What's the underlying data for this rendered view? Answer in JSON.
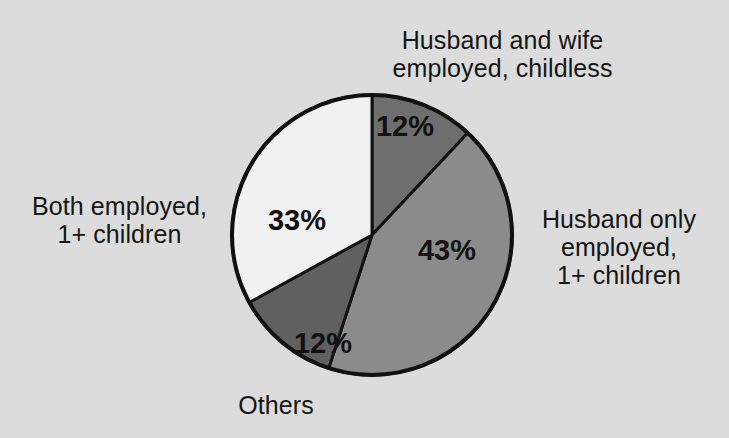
{
  "figure": {
    "background_color": "#dcdcdc",
    "title": ""
  },
  "chart_data": {
    "type": "pie",
    "title": "",
    "xlabel": "",
    "ylabel": "",
    "legend_position": "callouts-around-pie",
    "grid": false,
    "start_angle_deg": 0,
    "direction": "clockwise",
    "center": {
      "x": 372,
      "y": 235
    },
    "radius": 140,
    "categories": [
      "Husband and wife employed, childless",
      "Husband only employed, 1+ children",
      "Others",
      "Both employed, 1+ children"
    ],
    "values": [
      12,
      43,
      12,
      33
    ],
    "value_labels": [
      "12%",
      "43%",
      "12%",
      "33%"
    ],
    "colors": [
      "#6e6e6e",
      "#8b8b8b",
      "#606060",
      "#f1f1f1"
    ],
    "slices": [
      {
        "label": "Husband and wife employed, childless",
        "label_lines": [
          "Husband and wife",
          "employed, childless"
        ],
        "value": 12,
        "value_label": "12%",
        "color": "#6e6e6e",
        "start_deg": 0,
        "end_deg": 43.2,
        "value_x": 405,
        "value_y": 128
      },
      {
        "label": "Husband only employed, 1+ children",
        "label_lines": [
          "Husband only",
          "employed,",
          "1+ children"
        ],
        "value": 43,
        "value_label": "43%",
        "color": "#8b8b8b",
        "start_deg": 43.2,
        "end_deg": 198.0,
        "value_x": 447,
        "value_y": 252
      },
      {
        "label": "Others",
        "label_lines": [
          "Others"
        ],
        "value": 12,
        "value_label": "12%",
        "color": "#606060",
        "start_deg": 198.0,
        "end_deg": 241.2,
        "value_x": 323,
        "value_y": 345
      },
      {
        "label": "Both employed, 1+ children",
        "label_lines": [
          "Both employed,",
          "1+ children"
        ],
        "value": 33,
        "value_label": "33%",
        "color": "#f1f1f1",
        "start_deg": 241.2,
        "end_deg": 360.0,
        "value_x": 297,
        "value_y": 222
      }
    ]
  },
  "callouts": {
    "top": "Husband and wife\nemployed, childless",
    "left": "Both employed,\n1+ children",
    "right": "Husband only\nemployed,\n1+ children",
    "bottom": "Others"
  },
  "values": {
    "top_slice": "12%",
    "right_slice": "43%",
    "bottom_slice": "12%",
    "left_slice": "33%"
  },
  "style": {
    "outline_color": "#111111",
    "text_color": "#141414"
  }
}
